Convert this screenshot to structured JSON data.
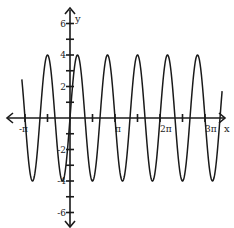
{
  "chart_data": {
    "type": "line",
    "title": "",
    "function": "y = 4 sin(3x)",
    "xlabel": "x",
    "ylabel": "y",
    "xlim": [
      -1.07,
      3.38
    ],
    "xlim_units": "multiples of pi",
    "ylim": [
      -7,
      7
    ],
    "grid": false,
    "x_ticks": [
      {
        "value": -1.0,
        "label": "-π"
      },
      {
        "value": -0.5,
        "label": ""
      },
      {
        "value": 0.5,
        "label": ""
      },
      {
        "value": 1.0,
        "label": "π"
      },
      {
        "value": 1.5,
        "label": ""
      },
      {
        "value": 2.0,
        "label": "2π"
      },
      {
        "value": 2.5,
        "label": ""
      },
      {
        "value": 3.0,
        "label": "3π"
      }
    ],
    "y_ticks": [
      {
        "value": 6,
        "label": "6"
      },
      {
        "value": 5,
        "label": ""
      },
      {
        "value": 4,
        "label": "4"
      },
      {
        "value": 3,
        "label": ""
      },
      {
        "value": 2,
        "label": "2"
      },
      {
        "value": 1,
        "label": ""
      },
      {
        "value": -1,
        "label": ""
      },
      {
        "value": -2,
        "label": "-2"
      },
      {
        "value": -3,
        "label": ""
      },
      {
        "value": -4,
        "label": "-4"
      },
      {
        "value": -5,
        "label": ""
      },
      {
        "value": -6,
        "label": "-6"
      }
    ],
    "series": [
      {
        "name": "y = 4 sin(3x)",
        "amplitude": 4,
        "period_pi": 0.667,
        "peaks_x_pi": [
          -0.5,
          0.167,
          0.833,
          1.5,
          2.167,
          2.833
        ],
        "troughs_x_pi": [
          -0.833,
          -0.167,
          0.5,
          1.167,
          1.833,
          2.5,
          3.167
        ],
        "peak_y": 4,
        "trough_y": -4
      }
    ],
    "legend": null
  },
  "axes": {
    "x_axis_label": "x",
    "y_axis_label": "y"
  },
  "colors": {
    "curve": "#1a1a1a",
    "axes": "#1a1a1a",
    "background": "#ffffff"
  }
}
